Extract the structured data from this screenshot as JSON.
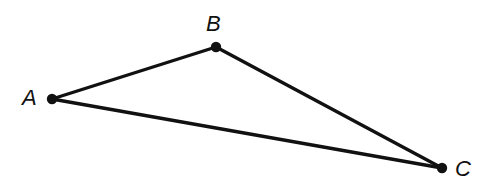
{
  "figure": {
    "kind": "geometry-diagram",
    "shape": "triangle",
    "background_color": "#ffffff",
    "stroke_color": "#111111",
    "stroke_width": 3.4,
    "vertex_dot_color": "#111111",
    "vertex_dot_radius": 5.2,
    "canvas": {
      "width": 491,
      "height": 191
    },
    "vertices": [
      {
        "id": "A",
        "label": "A",
        "x": 52,
        "y": 99,
        "label_x": 22,
        "label_y": 87,
        "label_anchor": "left"
      },
      {
        "id": "B",
        "label": "B",
        "x": 216,
        "y": 47,
        "label_x": 206,
        "label_y": 13,
        "label_anchor": "left"
      },
      {
        "id": "C",
        "label": "C",
        "x": 442,
        "y": 168,
        "label_x": 455,
        "label_y": 158,
        "label_anchor": "left"
      }
    ],
    "edges": [
      {
        "id": "AB",
        "from": "A",
        "to": "B"
      },
      {
        "id": "BC",
        "from": "B",
        "to": "C"
      },
      {
        "id": "AC",
        "from": "A",
        "to": "C"
      }
    ]
  }
}
